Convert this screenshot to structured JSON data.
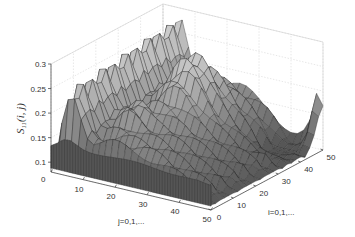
{
  "chart_data": {
    "type": "surface",
    "title": "",
    "xlabel": "j=0,1,...",
    "ylabel": "i=0,1,...",
    "zlabel": "S11(i,j)",
    "zlabel_display": {
      "base": "S",
      "sub": "11",
      "args": "(i, j)"
    },
    "x_ticks": [
      0,
      10,
      20,
      30,
      40,
      50
    ],
    "y_ticks": [
      0,
      10,
      20,
      30,
      40,
      50
    ],
    "z_ticks": [
      0.1,
      0.15,
      0.2,
      0.25,
      0.3
    ],
    "z_tick_labels": [
      "0.1",
      "0.15",
      "0.2",
      "0.25",
      "0.3"
    ],
    "xlim": [
      0,
      50
    ],
    "ylim": [
      0,
      50
    ],
    "zlim": [
      0.08,
      0.3
    ],
    "grid": true,
    "grid_size": 51,
    "colormap": "gray",
    "surface_description": "Rippled surface; baseline ~0.09 near j=0 edge rising to ~0.2, ridge along i near j≈5 with periodic ripples (~0.22-0.26), central peaks near i≈30-35, j≈15-25 reaching ~0.27, valley toward j=50,i=40-50 dropping to ~0.12 with a small rise at corner (~0.2).",
    "approx_samples": [
      {
        "i": 0,
        "j": 0,
        "z": 0.09
      },
      {
        "i": 0,
        "j": 50,
        "z": 0.09
      },
      {
        "i": 25,
        "j": 5,
        "z": 0.23
      },
      {
        "i": 45,
        "j": 5,
        "z": 0.25
      },
      {
        "i": 35,
        "j": 20,
        "z": 0.27
      },
      {
        "i": 30,
        "j": 25,
        "z": 0.24
      },
      {
        "i": 20,
        "j": 30,
        "z": 0.18
      },
      {
        "i": 45,
        "j": 40,
        "z": 0.13
      },
      {
        "i": 50,
        "j": 50,
        "z": 0.2
      }
    ]
  },
  "axes": {
    "j_label": "j=0,1,...",
    "i_label": "i=0,1,...",
    "z_zero_label": "0"
  }
}
